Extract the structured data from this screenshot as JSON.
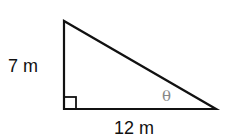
{
  "figure": {
    "shape": "right-triangle",
    "vertical_side_label": "7 m",
    "horizontal_side_label": "12 m",
    "angle_label": "θ",
    "right_angle_marker": true,
    "colors": {
      "stroke": "#111111",
      "angle_label": "#888888",
      "background": "#ffffff"
    }
  }
}
